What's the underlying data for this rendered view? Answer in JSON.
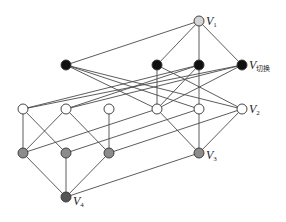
{
  "diagram": {
    "type": "lattice-graph",
    "colors": {
      "top": "#d4d4d4",
      "black": "#111111",
      "white": "#ffffff",
      "gray": "#8c8c8c",
      "bottom": "#555555",
      "edge": "#4a4a4a"
    },
    "nodes": [
      {
        "id": "V1",
        "x": 199,
        "y": 21,
        "fill": "top"
      },
      {
        "id": "B1",
        "x": 66,
        "y": 65,
        "fill": "black"
      },
      {
        "id": "B2",
        "x": 157,
        "y": 65,
        "fill": "black"
      },
      {
        "id": "B3",
        "x": 199,
        "y": 65,
        "fill": "black"
      },
      {
        "id": "Vswitch",
        "x": 242,
        "y": 65,
        "fill": "black"
      },
      {
        "id": "W1",
        "x": 23,
        "y": 109,
        "fill": "white"
      },
      {
        "id": "W2",
        "x": 66,
        "y": 109,
        "fill": "white"
      },
      {
        "id": "W3",
        "x": 109,
        "y": 109,
        "fill": "white"
      },
      {
        "id": "W4",
        "x": 157,
        "y": 109,
        "fill": "white"
      },
      {
        "id": "W5",
        "x": 199,
        "y": 109,
        "fill": "white"
      },
      {
        "id": "V2",
        "x": 242,
        "y": 109,
        "fill": "white"
      },
      {
        "id": "G1",
        "x": 23,
        "y": 153,
        "fill": "gray"
      },
      {
        "id": "G2",
        "x": 66,
        "y": 153,
        "fill": "gray"
      },
      {
        "id": "G3",
        "x": 109,
        "y": 153,
        "fill": "gray"
      },
      {
        "id": "V3",
        "x": 199,
        "y": 153,
        "fill": "gray"
      },
      {
        "id": "V4",
        "x": 66,
        "y": 197,
        "fill": "bottom"
      }
    ],
    "edges": [
      [
        "V1",
        "B1"
      ],
      [
        "V1",
        "B2"
      ],
      [
        "V1",
        "B3"
      ],
      [
        "V1",
        "Vswitch"
      ],
      [
        "B1",
        "W4"
      ],
      [
        "B1",
        "W5"
      ],
      [
        "B1",
        "V2"
      ],
      [
        "B2",
        "W4"
      ],
      [
        "B2",
        "V2"
      ],
      [
        "B3",
        "W5"
      ],
      [
        "B3",
        "W4"
      ],
      [
        "B3",
        "W1"
      ],
      [
        "B3",
        "W2"
      ],
      [
        "Vswitch",
        "W1"
      ],
      [
        "Vswitch",
        "W2"
      ],
      [
        "Vswitch",
        "W4"
      ],
      [
        "W1",
        "G1"
      ],
      [
        "W1",
        "G2"
      ],
      [
        "W2",
        "G1"
      ],
      [
        "W2",
        "G3"
      ],
      [
        "W3",
        "G3"
      ],
      [
        "W4",
        "G1"
      ],
      [
        "W4",
        "V3"
      ],
      [
        "W5",
        "G2"
      ],
      [
        "W5",
        "V3"
      ],
      [
        "V2",
        "G3"
      ],
      [
        "V2",
        "V3"
      ],
      [
        "G1",
        "V4"
      ],
      [
        "G2",
        "V4"
      ],
      [
        "G3",
        "V4"
      ],
      [
        "V3",
        "V4"
      ]
    ],
    "labels": [
      {
        "node": "V1",
        "main": "V",
        "sub": "1",
        "dx": 7,
        "dy": 4
      },
      {
        "node": "Vswitch",
        "main": "V",
        "sub": "切换",
        "dx": 7,
        "dy": 4
      },
      {
        "node": "V2",
        "main": "V",
        "sub": "2",
        "dx": 7,
        "dy": 4
      },
      {
        "node": "V3",
        "main": "V",
        "sub": "3",
        "dx": 7,
        "dy": 6
      },
      {
        "node": "V4",
        "main": "V",
        "sub": "4",
        "dx": 7,
        "dy": 8
      }
    ]
  }
}
